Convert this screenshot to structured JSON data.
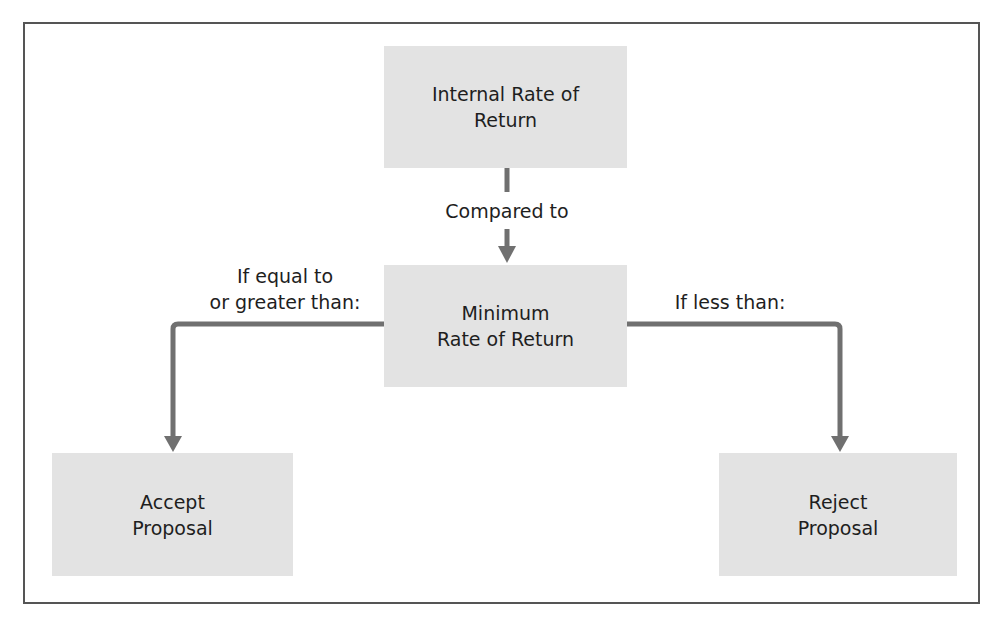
{
  "diagram": {
    "colors": {
      "box_fill": "#e3e3e3",
      "arrow": "#707070",
      "frame": "#555555",
      "text": "#1e1e1e"
    },
    "nodes": {
      "irr": {
        "line1": "Internal Rate of",
        "line2": "Return"
      },
      "minimum": {
        "line1": "Minimum",
        "line2": "Rate of Return"
      },
      "accept": {
        "line1": "Accept",
        "line2": "Proposal"
      },
      "reject": {
        "line1": "Reject",
        "line2": "Proposal"
      }
    },
    "edges": {
      "compared": {
        "label": "Compared to"
      },
      "accept": {
        "line1": "If equal to",
        "line2": "or greater than:"
      },
      "reject": {
        "label": "If less than:"
      }
    }
  }
}
